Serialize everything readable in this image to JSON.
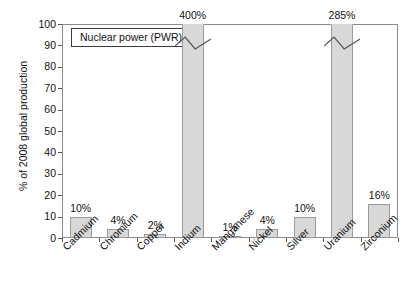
{
  "chart_data": {
    "type": "bar",
    "title": "",
    "subtitle": "",
    "xlabel": "",
    "ylabel": "% of 2008 global production",
    "ylim": [
      0,
      100
    ],
    "yticks": [
      0,
      10,
      20,
      30,
      40,
      50,
      60,
      70,
      80,
      90,
      100
    ],
    "grid": false,
    "legend_position": "top-left-inside",
    "legend_entries": [
      "Nuclear power (PWR)"
    ],
    "categories": [
      "Cadmium",
      "Chromium",
      "Copper",
      "Indium",
      "Manganese",
      "Nickel",
      "Silver",
      "Uranium",
      "Zirconium"
    ],
    "values": [
      10,
      4,
      2,
      400,
      1,
      4,
      10,
      285,
      16
    ],
    "data_labels": [
      "10%",
      "4%",
      "2%",
      "400%",
      "1%",
      "4%",
      "10%",
      "285%",
      "16%"
    ],
    "clipped": [
      false,
      false,
      false,
      true,
      false,
      false,
      false,
      true,
      false
    ],
    "clipped_note": "Bars exceeding the 100% axis maximum are drawn to the top of the plot with an axis-break zigzag mark",
    "bar_fill": "#d8d8d8",
    "bar_edge": "#9a9a9a",
    "frame_color": "#8a8a8a",
    "background": "#ffffff"
  },
  "axis": {
    "y_title": "% of 2008 global production",
    "tick_labels": [
      "100",
      "90",
      "80",
      "70",
      "60",
      "50",
      "40",
      "30",
      "20",
      "10",
      "0"
    ]
  },
  "legend": {
    "label": "Nuclear power (PWR)"
  }
}
